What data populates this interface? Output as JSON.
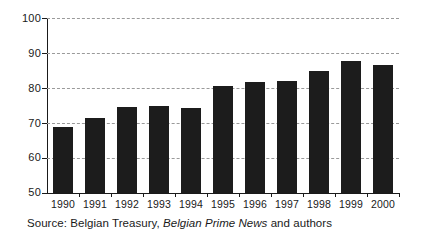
{
  "chart_data": {
    "type": "bar",
    "title": "",
    "subtitle": "",
    "xlabel": "",
    "ylabel": "",
    "categories": [
      "1990",
      "1991",
      "1992",
      "1993",
      "1994",
      "1995",
      "1996",
      "1997",
      "1998",
      "1999",
      "2000"
    ],
    "values": [
      69,
      71.5,
      74.5,
      74.8,
      74.4,
      80.6,
      81.6,
      82,
      85,
      87.6,
      86.6
    ],
    "ylim": [
      50,
      100
    ],
    "yticks": [
      50,
      60,
      70,
      80,
      90,
      100
    ],
    "ytick_labels": [
      "50",
      "60",
      "70",
      "80",
      "90",
      "100"
    ],
    "grid": "horizontal-dashed",
    "legend": "none",
    "bar_color": "#1c1c1c",
    "gridline_color": "#9a9a9a",
    "axis_color": "#1a1a1a",
    "background": "#ffffff"
  },
  "caption": {
    "prefix": "Source: Belgian Treasury, ",
    "italic": "Belgian Prime News",
    "suffix": " and authors"
  }
}
